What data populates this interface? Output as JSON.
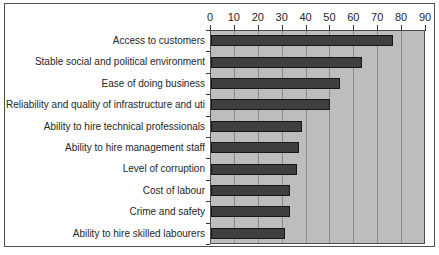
{
  "chart_data": {
    "type": "bar",
    "orientation": "horizontal",
    "title": "",
    "xlabel": "",
    "ylabel": "",
    "categories": [
      "Access to customers",
      "Stable social and political environment",
      "Ease of doing business",
      "Reliability and quality of infrastructure and utilities",
      "Ability to hire technical professionals",
      "Ability to hire management staff",
      "Level of corruption",
      "Cost of labour",
      "Crime and safety",
      "Ability to hire skilled labourers"
    ],
    "values": [
      76,
      63,
      54,
      50,
      38,
      37,
      36,
      33,
      33,
      31
    ],
    "xlim": [
      0,
      90
    ],
    "xticks": [
      0,
      10,
      20,
      30,
      40,
      50,
      60,
      70,
      80,
      90
    ],
    "grid": "vertical",
    "legend": "none",
    "axis_position": "top",
    "colors": {
      "bar_fill": "#3f3f3f",
      "bar_border": "#161616",
      "plot_background": "#bdbdbd",
      "gridline": "#8c8c8c",
      "axis_line": "#4d4d4d",
      "tick": "#333333",
      "text": "#262626",
      "frame_border": "#4f4f4f",
      "page_background": "#ffffff"
    }
  }
}
